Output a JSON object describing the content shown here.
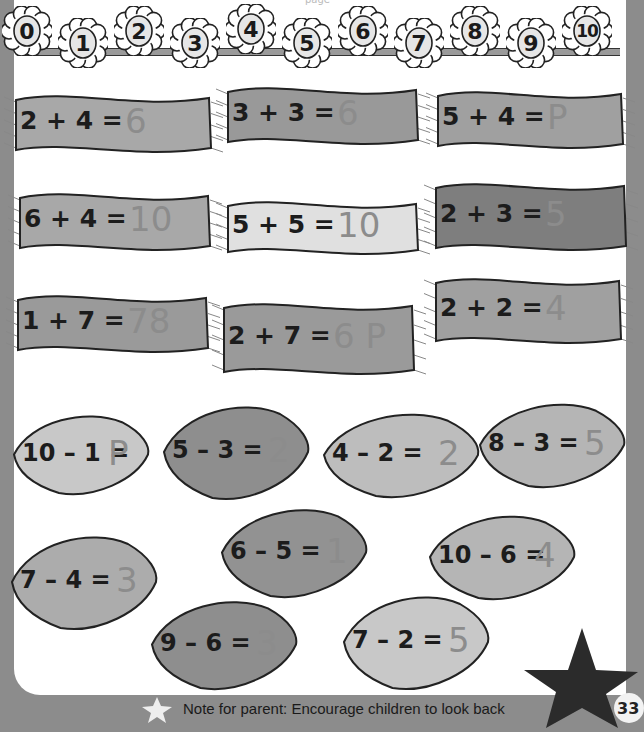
{
  "page": {
    "top_text_fragment": "page",
    "page_number": "33"
  },
  "number_line": {
    "numbers": [
      "0",
      "1",
      "2",
      "3",
      "4",
      "5",
      "6",
      "7",
      "8",
      "9",
      "10"
    ]
  },
  "additions": [
    {
      "equation": "2 + 4 =",
      "answer": "6",
      "shade": "#a8a8a8"
    },
    {
      "equation": "3 + 3 =",
      "answer": "6",
      "shade": "#999999"
    },
    {
      "equation": "5 + 4 =",
      "answer": "P",
      "shade": "#a0a0a0"
    },
    {
      "equation": "6 + 4 =",
      "answer": "10",
      "shade": "#a8a8a8"
    },
    {
      "equation": "5 + 5 =",
      "answer": "10",
      "shade": "#e0e0e0"
    },
    {
      "equation": "2 + 3 =",
      "answer": "5",
      "shade": "#7e7e7e"
    },
    {
      "equation": "1 + 7 =",
      "answer": "78",
      "shade": "#9a9a9a"
    },
    {
      "equation": "2 + 7 =",
      "answer": "6 P",
      "shade": "#9a9a9a"
    },
    {
      "equation": "2 + 2 =",
      "answer": "4",
      "shade": "#a0a0a0"
    }
  ],
  "subtractions": [
    {
      "equation": "10 – 1 =",
      "answer": "P",
      "shade": "#c8c8c8"
    },
    {
      "equation": "5 – 3 =",
      "answer": "2",
      "shade": "#8e8e8e"
    },
    {
      "equation": "4 – 2 =",
      "answer": "2",
      "shade": "#bdbdbd"
    },
    {
      "equation": "8 – 3 =",
      "answer": "5",
      "shade": "#b5b5b5"
    },
    {
      "equation": "6 – 5 =",
      "answer": "1",
      "shade": "#929292"
    },
    {
      "equation": "7 – 4 =",
      "answer": "3",
      "shade": "#acacac"
    },
    {
      "equation": "10 – 6 =",
      "answer": "4",
      "shade": "#b5b5b5"
    },
    {
      "equation": "9 – 6 =",
      "answer": "3",
      "shade": "#8e8e8e"
    },
    {
      "equation": "7 – 2 =",
      "answer": "5",
      "shade": "#c8c8c8"
    }
  ],
  "footer": {
    "note": "Note for parent:  Encourage children to look back",
    "star_icon": "star-icon"
  },
  "colors": {
    "page_bg": "#ffffff",
    "border_gray": "#8c8c8c",
    "ink": "#1c1c1c",
    "pencil": "#8c8c8c",
    "big_star": "#2b2b2b"
  }
}
